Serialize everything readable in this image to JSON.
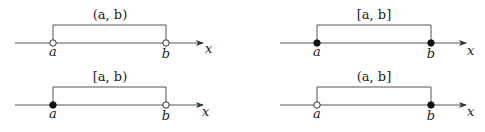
{
  "diagram": {
    "axis_label": "x",
    "panels": [
      {
        "id": "open",
        "interval": "(a, b)",
        "left_bracket": "(",
        "right_bracket": ")",
        "a_label": "a",
        "b_label": "b",
        "a_closed": false,
        "b_closed": false
      },
      {
        "id": "closed",
        "interval": "[a, b]",
        "left_bracket": "[",
        "right_bracket": "]",
        "a_label": "a",
        "b_label": "b",
        "a_closed": true,
        "b_closed": true
      },
      {
        "id": "half-open-right",
        "interval": "[a, b)",
        "left_bracket": "[",
        "right_bracket": ")",
        "a_label": "a",
        "b_label": "b",
        "a_closed": true,
        "b_closed": false
      },
      {
        "id": "half-open-left",
        "interval": "(a, b]",
        "left_bracket": "(",
        "right_bracket": "]",
        "a_label": "a",
        "b_label": "b",
        "a_closed": false,
        "b_closed": true
      }
    ]
  }
}
